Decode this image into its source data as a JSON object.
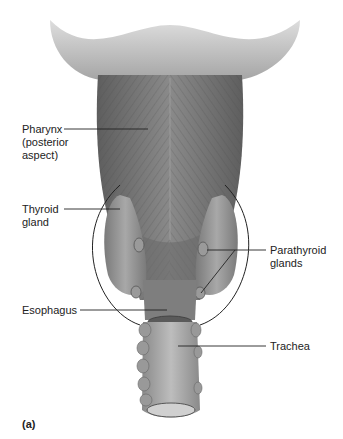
{
  "figure": {
    "panel_label": "(a)",
    "labels": {
      "pharynx": "Pharynx\n(posterior\naspect)",
      "thyroid": "Thyroid\ngland",
      "parathyroid": "Parathyroid\nglands",
      "esophagus": "Esophagus",
      "trachea": "Trachea"
    },
    "colors": {
      "tissue_dark": "#6e6e6e",
      "tissue_mid": "#8c8c8c",
      "tissue_light": "#b5b5b5",
      "leader_line": "#222222"
    }
  }
}
